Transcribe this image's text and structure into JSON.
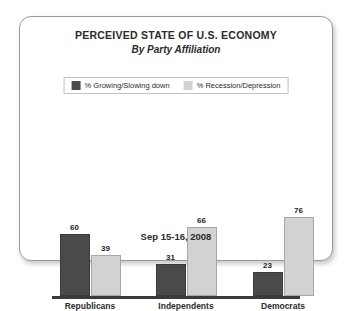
{
  "card": {
    "title": "PERCEIVED STATE OF U.S. ECONOMY",
    "subtitle": "By Party Affiliation",
    "footer_date": "Sep 15-16, 2008"
  },
  "legend": {
    "entries": [
      {
        "label": "% Growing/Slowing down",
        "color": "#4a4a4a"
      },
      {
        "label": "% Recession/Depression",
        "color": "#d2d2d2"
      }
    ]
  },
  "chart_data": {
    "type": "bar",
    "title": "PERCEIVED STATE OF U.S. ECONOMY",
    "subtitle": "By Party Affiliation",
    "xlabel": "",
    "ylabel": "",
    "ylim": [
      0,
      80
    ],
    "grid": false,
    "legend_position": "top-center",
    "annotation": "Sep 15-16, 2008",
    "categories": [
      "Republicans",
      "Independents",
      "Democrats"
    ],
    "series": [
      {
        "name": "% Growing/Slowing down",
        "color": "#4a4a4a",
        "values": [
          60,
          31,
          23
        ]
      },
      {
        "name": "% Recession/Depression",
        "color": "#d2d2d2",
        "values": [
          39,
          66,
          76
        ]
      }
    ]
  }
}
